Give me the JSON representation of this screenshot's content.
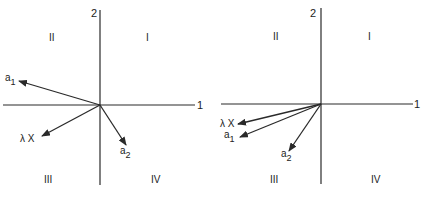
{
  "figures": [
    {
      "id": "left",
      "axes": {
        "horizontal_label": "1",
        "vertical_label": "2"
      },
      "quadrants": {
        "I": "I",
        "II": "II",
        "III": "III",
        "IV": "IV"
      },
      "vectors": [
        {
          "name": "a1",
          "label_main": "a",
          "label_sub": "1"
        },
        {
          "name": "lambdaX",
          "label_main": "λ X",
          "label_sub": ""
        },
        {
          "name": "a2",
          "label_main": "a",
          "label_sub": "2"
        }
      ]
    },
    {
      "id": "right",
      "axes": {
        "horizontal_label": "1",
        "vertical_label": "2"
      },
      "quadrants": {
        "I": "I",
        "II": "II",
        "III": "III",
        "IV": "IV"
      },
      "vectors": [
        {
          "name": "lambdaX",
          "label_main": "λ X",
          "label_sub": ""
        },
        {
          "name": "a1",
          "label_main": "a",
          "label_sub": "1"
        },
        {
          "name": "a2",
          "label_main": "a",
          "label_sub": "2"
        }
      ]
    }
  ]
}
